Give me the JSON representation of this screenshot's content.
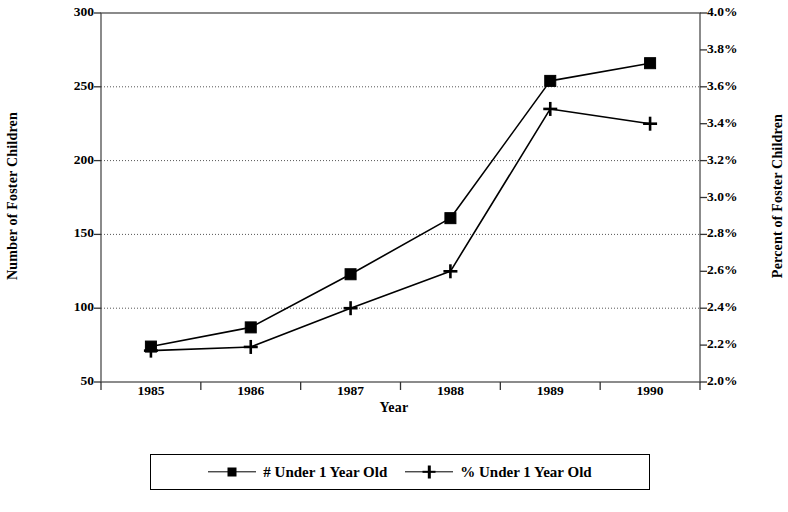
{
  "chart_data": {
    "type": "line",
    "title": "",
    "subtitle": "",
    "xlabel": "Year",
    "ylabel": "Number of Foster Children",
    "y2label": "Percent of Foster Children",
    "categories": [
      "1985",
      "1986",
      "1987",
      "1988",
      "1989",
      "1990"
    ],
    "x": [
      1985,
      1986,
      1987,
      1988,
      1989,
      1990
    ],
    "grid": true,
    "legend_position": "bottom",
    "ylim": [
      50,
      300
    ],
    "y_ticks": [
      50,
      100,
      150,
      200,
      250,
      300
    ],
    "y_tick_labels": [
      "50",
      "100",
      "150",
      "200",
      "250",
      "300"
    ],
    "y2lim": [
      2.0,
      4.0
    ],
    "y2_ticks": [
      2.0,
      2.2,
      2.4,
      2.6,
      2.8,
      3.0,
      3.2,
      3.4,
      3.6,
      3.8,
      4.0
    ],
    "y2_tick_labels": [
      "2.0%",
      "2.2%",
      "2.4%",
      "2.6%",
      "2.8%",
      "3.0%",
      "3.2%",
      "3.4%",
      "3.6%",
      "3.8%",
      "4.0%"
    ],
    "gridline_values": [
      100,
      150,
      200,
      250
    ],
    "series": [
      {
        "name": "# Under 1 Year Old",
        "axis": "left",
        "marker": "square",
        "color": "#000000",
        "values": [
          74,
          87,
          123,
          161,
          254,
          266
        ]
      },
      {
        "name": "% Under 1 Year Old",
        "axis": "right",
        "marker": "plus",
        "color": "#000000",
        "values": [
          2.17,
          2.19,
          2.4,
          2.6,
          3.48,
          3.4
        ]
      }
    ]
  },
  "axes": {
    "left_title": "Number of Foster Children",
    "right_title": "Percent of Foster Children",
    "x_title": "Year"
  },
  "legend": {
    "entries": [
      {
        "label": "# Under 1 Year Old",
        "marker": "square-marker"
      },
      {
        "label": "% Under 1 Year Old",
        "marker": "plus-marker"
      }
    ]
  }
}
